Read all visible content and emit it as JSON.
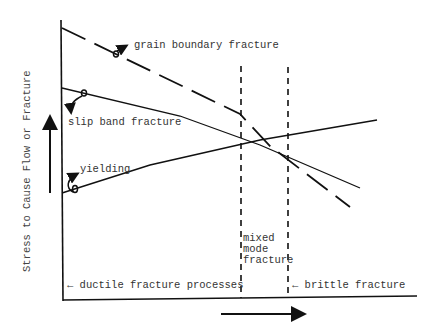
{
  "diagram": {
    "y_axis_label": "Stress to Cause Flow or Fracture",
    "curves": [
      {
        "id": "grain-boundary",
        "label": "grain boundary fracture",
        "style": "long-dash"
      },
      {
        "id": "slip-band",
        "label": "slip band fracture",
        "style": "solid"
      },
      {
        "id": "yielding",
        "label": "yielding",
        "style": "solid"
      }
    ],
    "regions": {
      "ductile": "← ductile fracture processes",
      "mixed_line1": "mixed",
      "mixed_line2": "mode",
      "mixed_line3": "fracture",
      "brittle": "← brittle fracture"
    },
    "colors": {
      "ink": "#111111",
      "text": "#333333",
      "background": "#ffffff"
    }
  }
}
